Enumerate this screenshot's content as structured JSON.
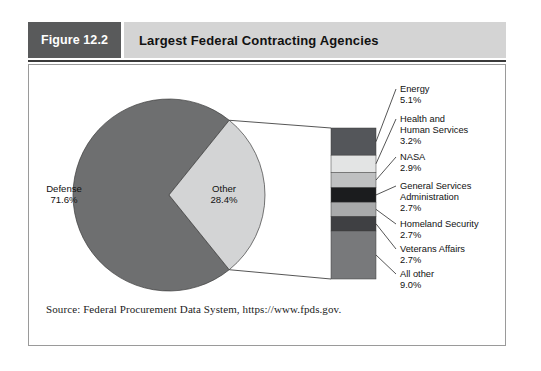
{
  "figure": {
    "tag": "Figure 12.2",
    "title": "Largest Federal Contracting Agencies",
    "source": "Source: Federal Procurement Data System, https://www.fpds.gov."
  },
  "chart_data": {
    "type": "pie",
    "title": "Largest Federal Contracting Agencies",
    "xlabel": "",
    "ylabel": "",
    "units": "percent of federal contracting dollars",
    "grid": false,
    "legend_position": "callout-right",
    "categories": [
      "Defense",
      "Other"
    ],
    "values": [
      71.6,
      28.4
    ],
    "labels": [
      "Defense\n71.6%",
      "Other\n28.4%"
    ],
    "slices": [
      {
        "name": "Defense",
        "value": 71.6,
        "value_label": "71.6%",
        "color": "#6e6f70"
      },
      {
        "name": "Other",
        "value": 28.4,
        "value_label": "28.4%",
        "color": "#d3d4d5"
      }
    ],
    "breakout": {
      "type": "bar",
      "orientation": "vertical-stacked",
      "of_slice": "Other",
      "total": 28.4,
      "categories": [
        "Energy",
        "Health and Human Services",
        "NASA",
        "General Services Administration",
        "Homeland Security",
        "Veterans Affairs",
        "All other"
      ],
      "values": [
        5.1,
        3.2,
        2.9,
        2.7,
        2.7,
        2.7,
        9.0
      ],
      "segments": [
        {
          "name": "Energy",
          "value": 5.1,
          "value_label": "5.1%",
          "label_lines": [
            "Energy"
          ],
          "color": "#54565a"
        },
        {
          "name": "Health and Human Services",
          "value": 3.2,
          "value_label": "3.2%",
          "label_lines": [
            "Health and",
            "Human Services"
          ],
          "color": "#e3e4e4"
        },
        {
          "name": "NASA",
          "value": 2.9,
          "value_label": "2.9%",
          "label_lines": [
            "NASA"
          ],
          "color": "#bfc0c1"
        },
        {
          "name": "General Services Administration",
          "value": 2.7,
          "value_label": "2.7%",
          "label_lines": [
            "General Services",
            "Administration"
          ],
          "color": "#1b1c1e"
        },
        {
          "name": "Homeland Security",
          "value": 2.7,
          "value_label": "2.7%",
          "label_lines": [
            "Homeland Security"
          ],
          "color": "#a9aaab"
        },
        {
          "name": "Veterans Affairs",
          "value": 2.7,
          "value_label": "2.7%",
          "label_lines": [
            "Veterans Affairs"
          ],
          "color": "#3f4043"
        },
        {
          "name": "All other",
          "value": 9.0,
          "value_label": "9.0%",
          "label_lines": [
            "All other"
          ],
          "color": "#78797b"
        }
      ]
    }
  },
  "colors": {
    "tag_background": "#595a5b",
    "title_background": "#d4d4d4",
    "rule": "#3a3a3a",
    "panel_border": "#9a9a9a",
    "text": "#111111",
    "defense": "#6e6f70",
    "other": "#d3d4d5"
  }
}
